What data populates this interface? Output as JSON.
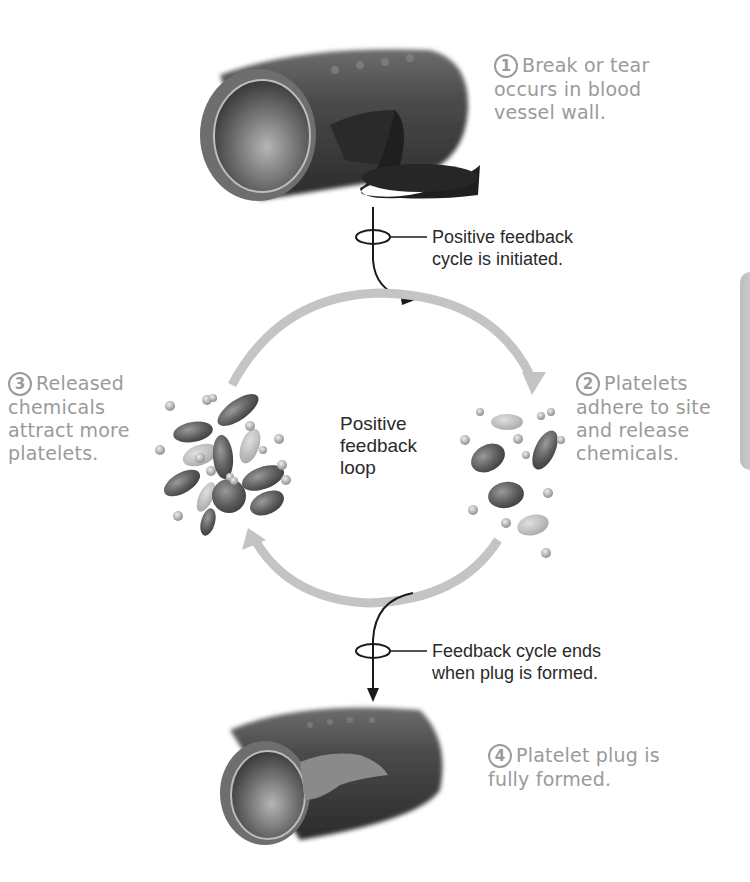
{
  "diagram": {
    "title_fragment": "",
    "steps": [
      {
        "number": "1",
        "text_lines": [
          "Break or tear",
          "occurs in blood",
          "vessel wall."
        ]
      },
      {
        "number": "2",
        "text_lines": [
          "Platelets",
          "adhere to site",
          "and release",
          "chemicals."
        ]
      },
      {
        "number": "3",
        "text_lines": [
          "Released",
          "chemicals",
          "attract more",
          "platelets."
        ]
      },
      {
        "number": "4",
        "text_lines": [
          "Platelet plug is",
          "fully formed."
        ]
      }
    ],
    "callouts": {
      "initiated": [
        "Positive feedback",
        "cycle is initiated."
      ],
      "ends": [
        "Feedback cycle ends",
        "when plug is formed."
      ]
    },
    "loop_label": [
      "Positive",
      "feedback",
      "loop"
    ],
    "colors": {
      "step_text": "#9a9a9a",
      "callout_text": "#2a2a2a",
      "loop_arrow": "#c4c4c4",
      "connector": "#1a1a1a",
      "side_tab": "#c2c2c2"
    }
  }
}
